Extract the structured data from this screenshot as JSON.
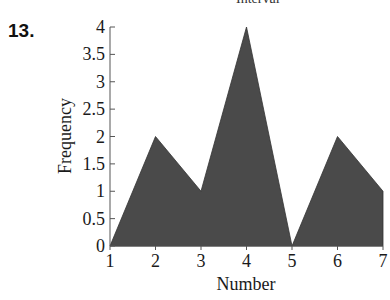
{
  "page": {
    "problem_number": "13.",
    "clipped_heading": "Interval"
  },
  "chart_data": {
    "type": "area",
    "title": "",
    "xlabel": "Number",
    "ylabel": "Frequency",
    "x": [
      1,
      2,
      3,
      4,
      5,
      6,
      7
    ],
    "values": [
      0,
      2,
      1,
      4,
      0,
      2,
      1
    ],
    "series": [
      {
        "name": "Frequency",
        "values": [
          0,
          2,
          1,
          4,
          0,
          2,
          1
        ]
      }
    ],
    "xticks": [
      "1",
      "2",
      "3",
      "4",
      "5",
      "6",
      "7"
    ],
    "yticks": [
      "0",
      "0.5",
      "1",
      "1.5",
      "2",
      "2.5",
      "3",
      "3.5",
      "4"
    ],
    "xlim": [
      1,
      7
    ],
    "ylim": [
      0,
      4
    ],
    "grid": false,
    "legend": "none",
    "fill_color": "#4a4a4a"
  }
}
